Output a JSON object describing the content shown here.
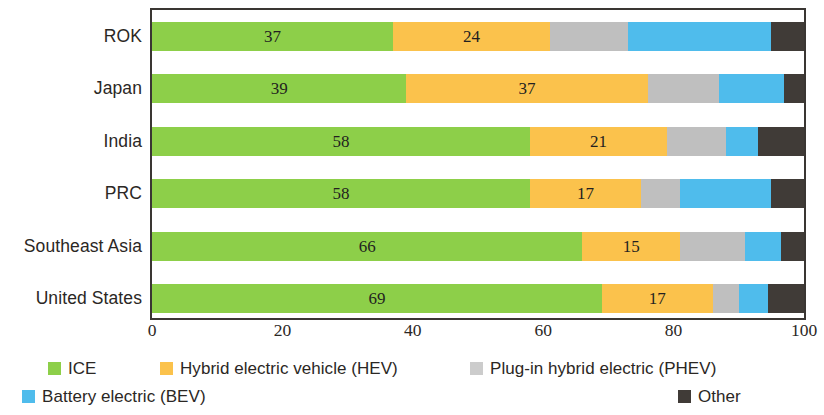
{
  "chart_data": {
    "type": "bar",
    "orientation": "horizontal",
    "stacked": true,
    "title": "",
    "subtitle": "",
    "xlabel": "",
    "ylabel": "",
    "xlim": [
      0,
      100
    ],
    "xticks": [
      0,
      20,
      40,
      60,
      80,
      100
    ],
    "grid": false,
    "legend_position": "bottom",
    "categories": [
      "ROK",
      "Japan",
      "India",
      "PRC",
      "Southeast Asia",
      "United States"
    ],
    "series": [
      {
        "name": "ICE",
        "color": "#8DCF49",
        "values": [
          37,
          39,
          58,
          58,
          66,
          69
        ],
        "labels": [
          "37",
          "39",
          "58",
          "58",
          "66",
          "69"
        ]
      },
      {
        "name": "Hybrid electric vehicle (HEV)",
        "color": "#FBC githubless"
      }
    ],
    "series_fixed": [
      {
        "name": "ICE",
        "color": "#8DCF49",
        "values": [
          37,
          39,
          58,
          58,
          66,
          69
        ],
        "labels": [
          "37",
          "39",
          "58",
          "58",
          "66",
          "69"
        ]
      },
      {
        "name": "Hybrid electric vehicle (HEV)",
        "color": "#FBC24C",
        "values": [
          24,
          37,
          21,
          17,
          15,
          17
        ],
        "labels": [
          "24",
          "37",
          "21",
          "17",
          "15",
          "17"
        ]
      },
      {
        "name": "Plug-in hybrid electric (PHEV)",
        "color": "#BFBFBF",
        "values": [
          12,
          11,
          9,
          6,
          10,
          4
        ],
        "labels": [
          "",
          "",
          "",
          "",
          "",
          ""
        ]
      },
      {
        "name": "Battery electric (BEV)",
        "color": "#4FBCEC",
        "values": [
          22,
          10,
          5,
          14,
          5.5,
          4.5
        ],
        "labels": [
          "",
          "",
          "",
          "",
          "",
          ""
        ]
      },
      {
        "name": "Other",
        "color": "#403B37",
        "values": [
          5,
          3,
          7,
          5,
          3.5,
          5.5
        ],
        "labels": [
          "",
          "",
          "",
          "",
          "",
          ""
        ]
      }
    ]
  },
  "axis": {
    "tick_labels": [
      "0",
      "20",
      "40",
      "60",
      "80",
      "100"
    ]
  },
  "legend": {
    "items": [
      {
        "label": "ICE",
        "color": "#8DCF49"
      },
      {
        "label": "Hybrid electric vehicle (HEV)",
        "color": "#FBC24C"
      },
      {
        "label": "Plug-in hybrid electric (PHEV)",
        "color": "#CCCCCC"
      },
      {
        "label": "Battery electric (BEV)",
        "color": "#4FBCEC"
      },
      {
        "label": "Other",
        "color": "#403B37"
      }
    ]
  }
}
